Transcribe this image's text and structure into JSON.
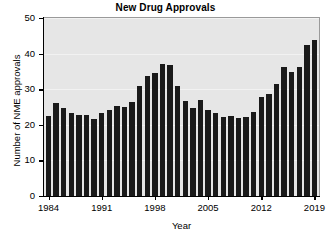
{
  "chart_data": {
    "type": "bar",
    "title": "New Drug Approvals",
    "xlabel": "Year",
    "ylabel": "Number of NME approvals",
    "ylim": [
      0,
      50
    ],
    "yticks": [
      0,
      10,
      20,
      30,
      40,
      50
    ],
    "xticks": [
      1984,
      1991,
      1998,
      2005,
      2012,
      2019
    ],
    "xlim": [
      1983.4,
      2019.6
    ],
    "grid": true,
    "legend": false,
    "bar_color": "#1a1a1a",
    "plot_background": "#e6e6e6",
    "categories": [
      1984,
      1985,
      1986,
      1987,
      1988,
      1989,
      1990,
      1991,
      1992,
      1993,
      1994,
      1995,
      1996,
      1997,
      1998,
      1999,
      2000,
      2001,
      2002,
      2003,
      2004,
      2005,
      2006,
      2007,
      2008,
      2009,
      2010,
      2011,
      2012,
      2013,
      2014,
      2015,
      2016,
      2017,
      2018,
      2019
    ],
    "values": [
      22.5,
      26.2,
      24.7,
      23.4,
      22.7,
      22.8,
      21.6,
      23.4,
      24.3,
      25.2,
      25.1,
      26.3,
      31.0,
      33.6,
      34.5,
      37.1,
      36.7,
      30.8,
      26.6,
      24.8,
      27.0,
      24.1,
      23.2,
      22.2,
      22.6,
      21.9,
      22.2,
      23.7,
      27.8,
      28.6,
      31.4,
      36.2,
      34.8,
      36.3,
      42.3,
      43.9
    ]
  }
}
